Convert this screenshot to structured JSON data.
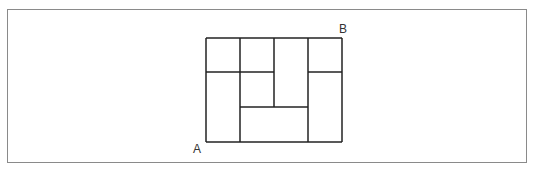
{
  "diagram": {
    "type": "grid-path",
    "labels": {
      "start": "A",
      "end": "B"
    },
    "stroke_color": "#222222",
    "frame_color": "#8a8a8a",
    "outer_rect": {
      "x1": 206,
      "y1": 38,
      "x2": 342,
      "y2": 142
    },
    "lines": [
      {
        "x1": 206,
        "y1": 38,
        "x2": 342,
        "y2": 38
      },
      {
        "x1": 206,
        "y1": 142,
        "x2": 342,
        "y2": 142
      },
      {
        "x1": 206,
        "y1": 38,
        "x2": 206,
        "y2": 142
      },
      {
        "x1": 342,
        "y1": 38,
        "x2": 342,
        "y2": 142
      },
      {
        "x1": 240,
        "y1": 38,
        "x2": 240,
        "y2": 142
      },
      {
        "x1": 274,
        "y1": 38,
        "x2": 274,
        "y2": 107
      },
      {
        "x1": 308,
        "y1": 38,
        "x2": 308,
        "y2": 142
      },
      {
        "x1": 206,
        "y1": 72,
        "x2": 274,
        "y2": 72
      },
      {
        "x1": 308,
        "y1": 72,
        "x2": 342,
        "y2": 72
      },
      {
        "x1": 240,
        "y1": 107,
        "x2": 308,
        "y2": 107
      }
    ]
  }
}
